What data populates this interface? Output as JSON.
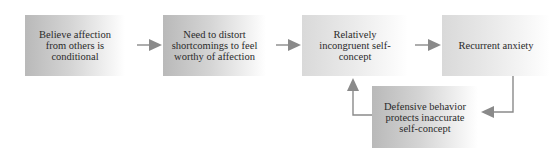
{
  "diagram": {
    "nodes": [
      {
        "id": "n1",
        "label": "Believe affection from others is conditional"
      },
      {
        "id": "n2",
        "label": "Need to distort shortcomings to feel worthy of affection"
      },
      {
        "id": "n3",
        "label": "Relatively incongruent self-concept"
      },
      {
        "id": "n4",
        "label": "Recurrent anxiety"
      },
      {
        "id": "n5",
        "label": "Defensive behavior protects inaccurate self-concept"
      }
    ],
    "edges": [
      {
        "from": "n1",
        "to": "n2"
      },
      {
        "from": "n2",
        "to": "n3"
      },
      {
        "from": "n3",
        "to": "n4"
      },
      {
        "from": "n4",
        "to": "n5"
      },
      {
        "from": "n5",
        "to": "n3"
      }
    ],
    "colors": {
      "arrow": "#8a8a8a",
      "box_dark": "#b9b9b9",
      "box_light": "#d9d9d9",
      "text": "#2a2a2a"
    }
  }
}
